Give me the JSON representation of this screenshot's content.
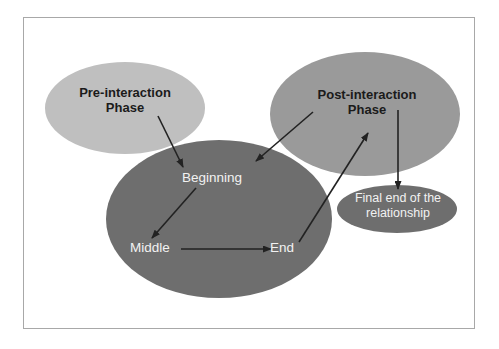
{
  "diagram": {
    "frame": {
      "border_color": "#a8a8a8",
      "background_color": "#ffffff"
    },
    "nodes": [
      {
        "id": "pre-interaction",
        "label": "Pre-interaction\nPhase",
        "shape": "ellipse",
        "fill": "#bfbfbf",
        "text_color": "#1b1b1b",
        "cx": 125,
        "cy": 108,
        "rx": 80,
        "ry": 46
      },
      {
        "id": "post-interaction",
        "label": "Post-interaction\nPhase",
        "shape": "ellipse",
        "fill": "#9a9a9a",
        "text_color": "#1b1b1b",
        "cx": 365,
        "cy": 114,
        "rx": 95,
        "ry": 62
      },
      {
        "id": "interaction-phase",
        "label": "",
        "shape": "ellipse",
        "fill": "#6e6e6e",
        "text_color": "#f2f2f2",
        "cx": 219,
        "cy": 219,
        "rx": 113,
        "ry": 79
      },
      {
        "id": "final-end",
        "label": "Final end of the\nrelationship",
        "shape": "ellipse",
        "fill": "#6e6e6e",
        "text_color": "#f2f2f2",
        "cx": 397,
        "cy": 209,
        "rx": 60,
        "ry": 24
      }
    ],
    "stages": [
      {
        "id": "beginning",
        "label": "Beginning",
        "x": 212,
        "y": 181
      },
      {
        "id": "middle",
        "label": "Middle",
        "x": 150,
        "y": 250
      },
      {
        "id": "end",
        "label": "End",
        "x": 282,
        "y": 250
      }
    ],
    "arrows": [
      {
        "id": "pre-to-beginning",
        "from": "pre-interaction",
        "to": "beginning",
        "x1": 158,
        "y1": 116,
        "x2": 183,
        "y2": 167
      },
      {
        "id": "post-to-beginning",
        "from": "post-interaction",
        "to": "beginning",
        "x1": 313,
        "y1": 112,
        "x2": 256,
        "y2": 161
      },
      {
        "id": "beginning-to-middle",
        "from": "beginning",
        "to": "middle",
        "x1": 196,
        "y1": 188,
        "x2": 152,
        "y2": 238
      },
      {
        "id": "middle-to-end",
        "from": "middle",
        "to": "end",
        "x1": 181,
        "y1": 249,
        "x2": 271,
        "y2": 249
      },
      {
        "id": "end-to-post",
        "from": "end",
        "to": "post-interaction",
        "x1": 299,
        "y1": 242,
        "x2": 368,
        "y2": 133
      },
      {
        "id": "post-to-final-end",
        "from": "post-interaction",
        "to": "final-end",
        "x1": 398,
        "y1": 110,
        "x2": 398,
        "y2": 189
      }
    ],
    "arrow_color": "#222222"
  }
}
